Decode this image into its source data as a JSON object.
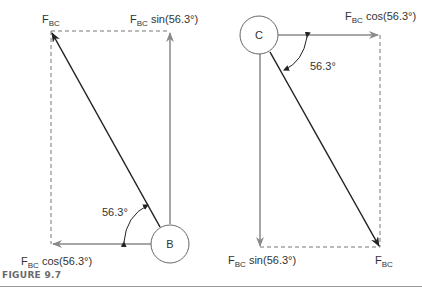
{
  "figure": {
    "caption": "FIGURE 9.7",
    "left_diagram": {
      "node_label": "B",
      "resultant": {
        "base": "F",
        "sub": "BC"
      },
      "vertical_component": {
        "base": "F",
        "sub": "BC",
        "expr": " sin(56.3°)"
      },
      "horizontal_component": {
        "base": "F",
        "sub": "BC",
        "expr": " cos(56.3°)"
      },
      "angle_label": "56.3°"
    },
    "right_diagram": {
      "node_label": "C",
      "resultant": {
        "base": "F",
        "sub": "BC"
      },
      "vertical_component": {
        "base": "F",
        "sub": "BC",
        "expr": " sin(56.3°)"
      },
      "horizontal_component": {
        "base": "F",
        "sub": "BC",
        "expr": " cos(56.3°)"
      },
      "angle_label": "56.3°"
    },
    "colors": {
      "component": "#8a8a8a",
      "resultant": "#222222",
      "dashed": "#777777",
      "circle": "#666666"
    }
  }
}
